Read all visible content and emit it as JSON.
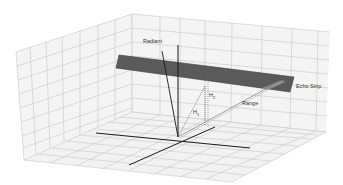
{
  "diagram": {
    "type": "3d-radar-geometry",
    "labels": {
      "radiant": "Radiant",
      "echo_strip": "Echo Strip",
      "range": "Range",
      "h1": "H",
      "h1_sub": "1",
      "h2": "H",
      "h2_sub": "2"
    },
    "colors": {
      "background": "#ffffff",
      "grid_line": "#c8c8c8",
      "wall_fill": "#f4f4f4",
      "floor_fill": "#f2f2f2",
      "echo_strip_fill": "#5a5a5a",
      "echo_strip_edge": "#3a3a3a",
      "axis_line": "#1a1a1a",
      "range_line": "#8a8a8a",
      "label_text": "#333333"
    }
  }
}
